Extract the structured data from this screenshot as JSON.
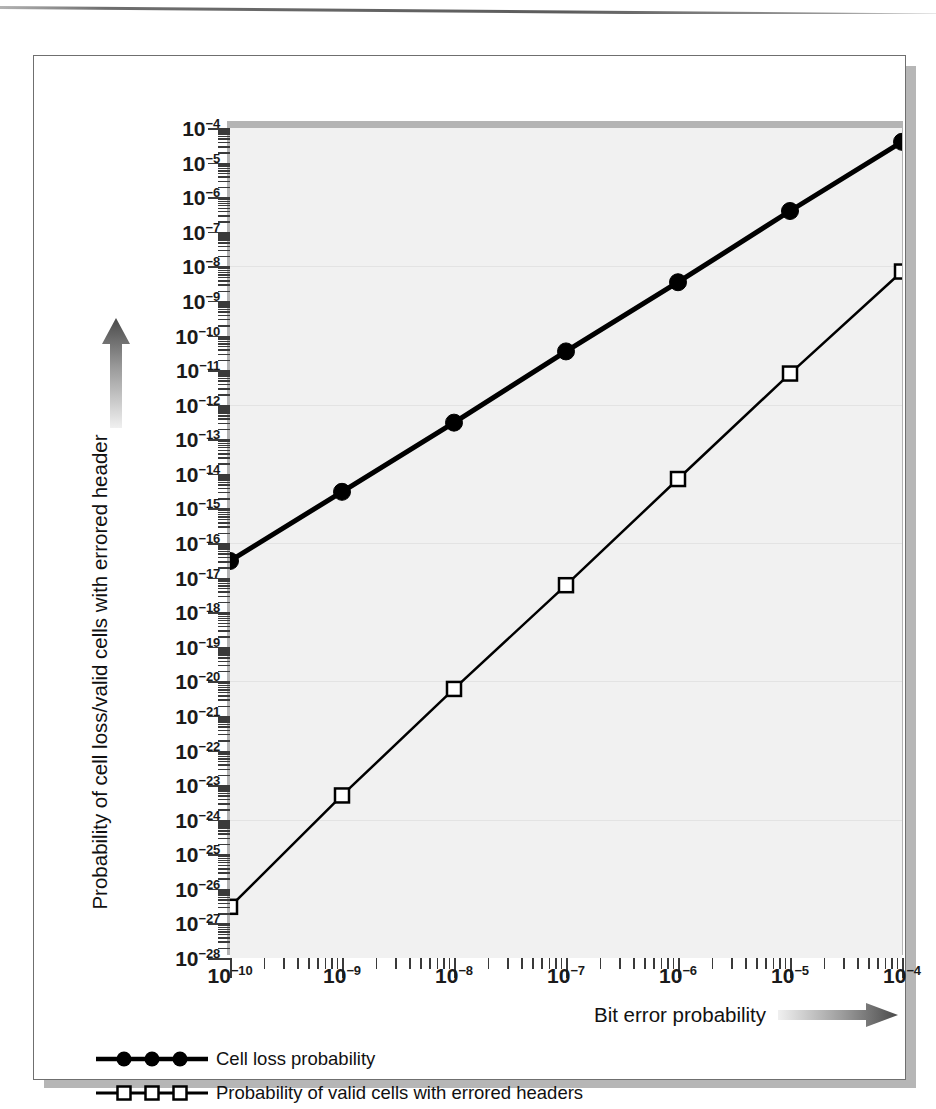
{
  "figure": {
    "y_axis_title": "Probability of cell loss/valid cells with errored header",
    "x_axis_title": "Bit error probability",
    "y_arrow_icon": "up-gradient-arrow",
    "x_arrow_icon": "right-gradient-arrow"
  },
  "legend": {
    "items": [
      {
        "label": "Cell loss probability",
        "marker": "filled-circle",
        "color": "#000000"
      },
      {
        "label": "Probability of valid cells with errored headers",
        "marker": "open-square",
        "color": "#000000"
      }
    ]
  },
  "chart_data": {
    "type": "line",
    "title": "",
    "subtitle": "",
    "xlabel": "Bit error probability",
    "ylabel": "Probability of cell loss/valid cells with errored header",
    "xscale": "log",
    "yscale": "log",
    "xlim": [
      1e-10,
      0.0001
    ],
    "ylim": [
      1e-28,
      0.0001
    ],
    "grid": true,
    "legend_position": "below-plot",
    "x_tick_labels": [
      "10⁻¹⁰",
      "10⁻⁹",
      "10⁻⁸",
      "10⁻⁷",
      "10⁻⁶",
      "10⁻⁵",
      "10⁻⁴"
    ],
    "x_tick_exponents": [
      -10,
      -9,
      -8,
      -7,
      -6,
      -5,
      -4
    ],
    "y_tick_labels": [
      "10⁻⁴",
      "10⁻⁵",
      "10⁻⁶",
      "10⁻⁷",
      "10⁻⁸",
      "10⁻⁹",
      "10⁻¹⁰",
      "10⁻¹¹",
      "10⁻¹²",
      "10⁻¹³",
      "10⁻¹⁴",
      "10⁻¹⁵",
      "10⁻¹⁶",
      "10⁻¹⁷",
      "10⁻¹⁸",
      "10⁻¹⁹",
      "10⁻²⁰",
      "10⁻²¹",
      "10⁻²²",
      "10⁻²³",
      "10⁻²⁴",
      "10⁻²⁵",
      "10⁻²⁶",
      "10⁻²⁷",
      "10⁻²⁸"
    ],
    "y_tick_exponents": [
      -4,
      -5,
      -6,
      -7,
      -8,
      -9,
      -10,
      -11,
      -12,
      -13,
      -14,
      -15,
      -16,
      -17,
      -18,
      -19,
      -20,
      -21,
      -22,
      -23,
      -24,
      -25,
      -26,
      -27,
      -28
    ],
    "x": [
      1e-10,
      1e-09,
      1e-08,
      1e-07,
      1e-06,
      1e-05,
      0.0001
    ],
    "series": [
      {
        "name": "Cell loss probability",
        "marker": "filled-circle",
        "color": "#000000",
        "linewidth": 5,
        "values": [
          3e-17,
          3e-15,
          3e-13,
          3.5e-11,
          3.5e-09,
          4e-07,
          4e-05
        ],
        "y_exponents": [
          -16.52,
          -14.52,
          -12.52,
          -10.46,
          -8.46,
          -6.4,
          -4.4
        ]
      },
      {
        "name": "Probability of valid cells with errored headers",
        "marker": "open-square",
        "color": "#000000",
        "linewidth": 2.5,
        "values": [
          3e-27,
          5e-24,
          6e-21,
          6e-18,
          7e-15,
          8e-12,
          7e-09
        ],
        "y_exponents": [
          -26.52,
          -23.3,
          -20.22,
          -17.22,
          -14.15,
          -11.1,
          -8.15
        ]
      }
    ]
  }
}
